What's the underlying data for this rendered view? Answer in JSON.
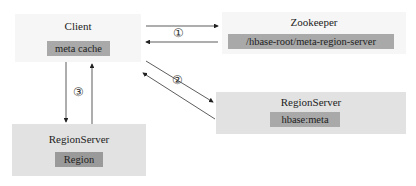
{
  "diagram": {
    "client": {
      "title": "Client",
      "inner": "meta cache"
    },
    "zookeeper": {
      "title": "Zookeeper",
      "inner": "/hbase-root/meta-region-server"
    },
    "meta_regionserver": {
      "title": "RegionServer",
      "inner": "hbase:meta"
    },
    "data_regionserver": {
      "title": "RegionServer",
      "inner": "Region"
    },
    "steps": {
      "one": "①",
      "two": "②",
      "three": "③"
    }
  }
}
